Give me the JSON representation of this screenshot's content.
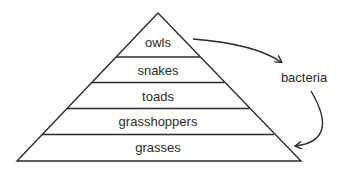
{
  "diagram": {
    "type": "food pyramid",
    "levels": [
      {
        "label": "owls"
      },
      {
        "label": "snakes"
      },
      {
        "label": "toads"
      },
      {
        "label": "grasshoppers"
      },
      {
        "label": "grasses"
      }
    ],
    "decomposer": {
      "label": "bacteria"
    },
    "arrows": [
      {
        "from": "owls",
        "to": "bacteria"
      },
      {
        "from": "bacteria",
        "to": "grasses"
      }
    ]
  }
}
